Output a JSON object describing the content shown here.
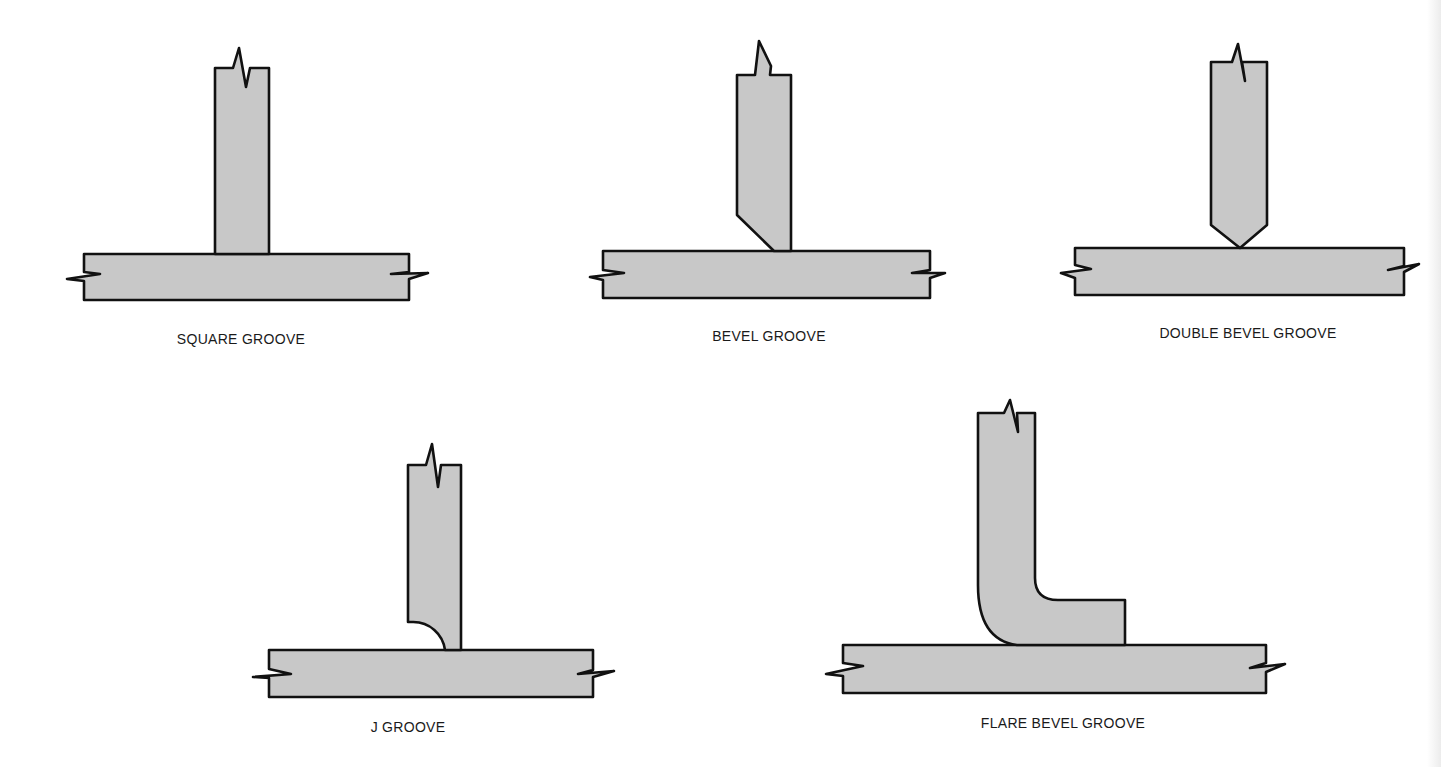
{
  "figure": {
    "colors": {
      "fill": "#c8c8c8",
      "stroke": "#111111",
      "background": "#ffffff",
      "label": "#1a1a1a"
    }
  },
  "diagrams": [
    {
      "id": "square",
      "label": "SQUARE GROOVE"
    },
    {
      "id": "bevel",
      "label": "BEVEL GROOVE"
    },
    {
      "id": "double-bevel",
      "label": "DOUBLE BEVEL GROOVE"
    },
    {
      "id": "j",
      "label": "J GROOVE"
    },
    {
      "id": "flare-bevel",
      "label": "FLARE BEVEL GROOVE"
    }
  ]
}
